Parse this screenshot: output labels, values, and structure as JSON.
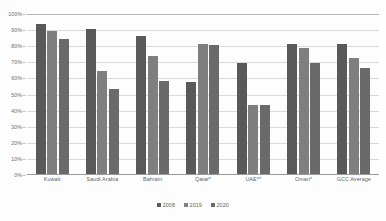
{
  "chart_data": {
    "type": "bar",
    "title": "",
    "subtitle": "",
    "xlabel": "",
    "ylabel": "",
    "ylim": [
      0,
      100
    ],
    "yticks": [
      "0%",
      "10%",
      "20%",
      "30%",
      "40%",
      "50%",
      "60%",
      "70%",
      "80%",
      "90%",
      "100%"
    ],
    "grid": true,
    "legend_position": "bottom",
    "categories": [
      "Kuwait",
      "Saudi Arabia",
      "Bahrain",
      "Qatar*",
      "UAE**",
      "Oman*",
      "GCC Average"
    ],
    "series": [
      {
        "name": "2008",
        "color": "#595959",
        "values": [
          93,
          90,
          86,
          57,
          69,
          81,
          81
        ]
      },
      {
        "name": "2019",
        "color": "#7f7f7f",
        "values": [
          89,
          64,
          73,
          81,
          43,
          78,
          72
        ]
      },
      {
        "name": "2020",
        "color": "#6a6a6a",
        "values": [
          84,
          53,
          58,
          80,
          43,
          69,
          66
        ]
      }
    ]
  }
}
